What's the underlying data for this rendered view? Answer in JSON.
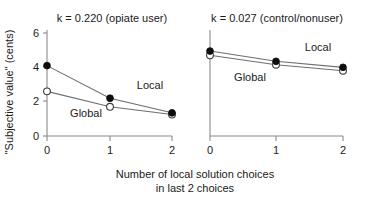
{
  "figure": {
    "background": "#ffffff",
    "ink_color": "#1a1a1a",
    "axis_color": "#8a8a8a",
    "line_color": "#6e6e6e",
    "ylabel": "\"Subjective value\" (cents)",
    "xlabel_line1": "Number of local solution choices",
    "xlabel_line2": "in last 2 choices",
    "panel_left_title": "k = 0.220 (opiate user)",
    "panel_right_title": "k = 0.027 (control/nonuser)",
    "series_label_local": "Local",
    "series_label_global": "Global",
    "ytick_0": "0",
    "ytick_2": "2",
    "ytick_4": "4",
    "ytick_6": "6",
    "xtick_l_0": "0",
    "xtick_l_1": "1",
    "xtick_l_2": "2",
    "xtick_r_0": "0",
    "xtick_r_1": "1",
    "xtick_r_2": "2"
  },
  "chart_data": {
    "type": "line",
    "title": "",
    "xlabel": "Number of local solution choices in last 2 choices",
    "ylabel": "\"Subjective value\" (cents)",
    "x": [
      0,
      1,
      2
    ],
    "xlim": [
      0,
      2
    ],
    "ylim": [
      0,
      6
    ],
    "yticks": [
      0,
      2,
      4,
      6
    ],
    "xticks": [
      0,
      1,
      2
    ],
    "grid": false,
    "legend_position": "inline-annotation",
    "panels": [
      {
        "title": "k = 0.220 (opiate user)",
        "name": "opiate-user",
        "series": [
          {
            "name": "Local",
            "marker": "filled-circle",
            "values": [
              4.1,
              2.2,
              1.35
            ]
          },
          {
            "name": "Global",
            "marker": "open-circle",
            "values": [
              2.6,
              1.7,
              1.25
            ]
          }
        ]
      },
      {
        "title": "k = 0.027 (control/nonuser)",
        "name": "control-nonuser",
        "series": [
          {
            "name": "Local",
            "marker": "filled-circle",
            "values": [
              4.95,
              4.35,
              4.0
            ]
          },
          {
            "name": "Global",
            "marker": "open-circle",
            "values": [
              4.7,
              4.15,
              3.8
            ]
          }
        ]
      }
    ]
  }
}
